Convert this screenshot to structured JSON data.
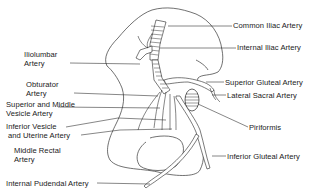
{
  "diagram": {
    "labels": {
      "common_iliac": "Common Iliac Artery",
      "internal_iliac": "Internal Iliac Artery",
      "iliolumbar": [
        "Iliolumbar",
        "Artery"
      ],
      "obturator": [
        "Obturator",
        "Artery"
      ],
      "superior_gluteal": "Superior Gluteal Artery",
      "lateral_sacral": "Lateral Sacral Artery",
      "superior_middle_vesicle": [
        "Superior and Middle",
        "Vesicle Artery"
      ],
      "inferior_vesicle_uterine": [
        "Inferior Vesicle",
        "and Uterine Artery"
      ],
      "piriformis": "Piriformis",
      "middle_rectal": [
        "Middle Rectal",
        "Artery"
      ],
      "inferior_gluteal": "Inferior Gluteal Artery",
      "internal_pudendal": "Internal Pudendal Artery"
    },
    "colors": {
      "ink": "#222222",
      "background": "#ffffff"
    }
  }
}
